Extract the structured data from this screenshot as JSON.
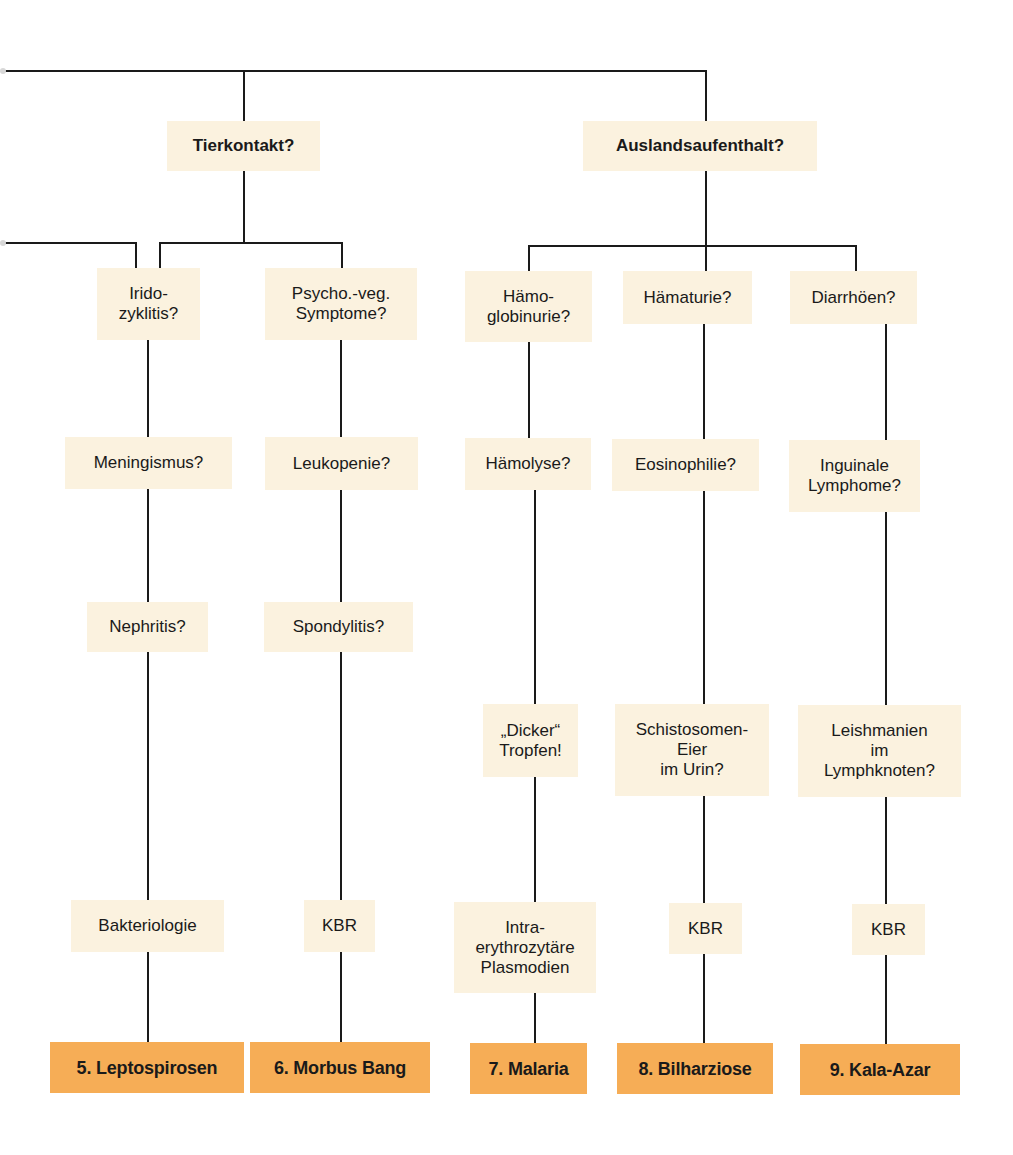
{
  "colors": {
    "line": "#1a1a1a",
    "question_box": "#fbf2df",
    "diagnosis_box": "#f6ad56",
    "text": "#1a1a1a"
  },
  "diagram": {
    "type": "flowchart",
    "continues_from_left": true,
    "branches": [
      {
        "id": "tierkontakt",
        "question": "Tierkontakt?",
        "box": {
          "x": 167,
          "y": 121,
          "w": 153,
          "h": 50
        },
        "columns": [
          {
            "id": "col-leptospirosen",
            "steps": [
              {
                "text": "Irido-\nzyklitis?",
                "box": {
                  "x": 97,
                  "y": 268,
                  "w": 103,
                  "h": 72
                }
              },
              {
                "text": "Meningismus?",
                "box": {
                  "x": 65,
                  "y": 437,
                  "w": 167,
                  "h": 52
                }
              },
              {
                "text": "Nephritis?",
                "box": {
                  "x": 87,
                  "y": 602,
                  "w": 121,
                  "h": 50
                }
              },
              {
                "text": "Bakteriologie",
                "box": {
                  "x": 71,
                  "y": 900,
                  "w": 153,
                  "h": 52
                }
              }
            ],
            "diagnosis": {
              "text": "5. Leptospirosen",
              "box": {
                "x": 50,
                "y": 1042,
                "w": 194,
                "h": 51
              }
            }
          },
          {
            "id": "col-morbus-bang",
            "steps": [
              {
                "text": "Psycho.-veg.\nSymptome?",
                "box": {
                  "x": 265,
                  "y": 268,
                  "w": 152,
                  "h": 72
                }
              },
              {
                "text": "Leukopenie?",
                "box": {
                  "x": 265,
                  "y": 437,
                  "w": 153,
                  "h": 53
                }
              },
              {
                "text": "Spondylitis?",
                "box": {
                  "x": 264,
                  "y": 602,
                  "w": 149,
                  "h": 50
                }
              },
              {
                "text": "KBR",
                "box": {
                  "x": 304,
                  "y": 900,
                  "w": 71,
                  "h": 52
                }
              }
            ],
            "diagnosis": {
              "text": "6. Morbus Bang",
              "box": {
                "x": 250,
                "y": 1042,
                "w": 180,
                "h": 51
              }
            }
          }
        ]
      },
      {
        "id": "auslandsaufenthalt",
        "question": "Auslandsaufenthalt?",
        "box": {
          "x": 583,
          "y": 121,
          "w": 234,
          "h": 50
        },
        "columns": [
          {
            "id": "col-malaria",
            "steps": [
              {
                "text": "Hämo-\nglobinurie?",
                "box": {
                  "x": 465,
                  "y": 271,
                  "w": 127,
                  "h": 71
                }
              },
              {
                "text": "Hämolyse?",
                "box": {
                  "x": 465,
                  "y": 438,
                  "w": 126,
                  "h": 52
                }
              },
              {
                "text": "„Dicker“\nTropfen!",
                "box": {
                  "x": 483,
                  "y": 704,
                  "w": 95,
                  "h": 73
                }
              },
              {
                "text": "Intra-\nerythrozytäre\nPlasmodien",
                "box": {
                  "x": 454,
                  "y": 902,
                  "w": 142,
                  "h": 91
                }
              }
            ],
            "diagnosis": {
              "text": "7. Malaria",
              "box": {
                "x": 470,
                "y": 1043,
                "w": 117,
                "h": 51
              }
            }
          },
          {
            "id": "col-bilharziose",
            "steps": [
              {
                "text": "Hämaturie?",
                "box": {
                  "x": 623,
                  "y": 271,
                  "w": 129,
                  "h": 53
                }
              },
              {
                "text": "Eosinophilie?",
                "box": {
                  "x": 612,
                  "y": 439,
                  "w": 147,
                  "h": 52
                }
              },
              {
                "text": "Schistosomen-\nEier\nim Urin?",
                "box": {
                  "x": 615,
                  "y": 704,
                  "w": 154,
                  "h": 92
                }
              },
              {
                "text": "KBR",
                "box": {
                  "x": 669,
                  "y": 903,
                  "w": 73,
                  "h": 51
                }
              }
            ],
            "diagnosis": {
              "text": "8. Bilharziose",
              "box": {
                "x": 617,
                "y": 1043,
                "w": 156,
                "h": 51
              }
            }
          },
          {
            "id": "col-kala-azar",
            "steps": [
              {
                "text": "Diarrhöen?",
                "box": {
                  "x": 790,
                  "y": 271,
                  "w": 127,
                  "h": 53
                }
              },
              {
                "text": "Inguinale\nLymphome?",
                "box": {
                  "x": 789,
                  "y": 440,
                  "w": 131,
                  "h": 72
                }
              },
              {
                "text": "Leishmanien\nim\nLymphknoten?",
                "box": {
                  "x": 798,
                  "y": 705,
                  "w": 163,
                  "h": 92
                }
              },
              {
                "text": "KBR",
                "box": {
                  "x": 852,
                  "y": 904,
                  "w": 73,
                  "h": 51
                }
              }
            ],
            "diagnosis": {
              "text": "9. Kala-Azar",
              "box": {
                "x": 800,
                "y": 1044,
                "w": 160,
                "h": 51
              }
            }
          }
        ]
      }
    ],
    "lines": [
      {
        "from": [
          4,
          71
        ],
        "to": [
          706,
          71
        ]
      },
      {
        "from": [
          244,
          71
        ],
        "to": [
          244,
          121
        ]
      },
      {
        "from": [
          706,
          71
        ],
        "to": [
          706,
          121
        ]
      },
      {
        "from": [
          244,
          171
        ],
        "to": [
          244,
          243
        ]
      },
      {
        "from": [
          4,
          243
        ],
        "to": [
          136,
          243
        ]
      },
      {
        "from": [
          136,
          243
        ],
        "to": [
          136,
          268
        ]
      },
      {
        "from": [
          160,
          243
        ],
        "to": [
          342,
          243
        ]
      },
      {
        "from": [
          160,
          243
        ],
        "to": [
          160,
          268
        ]
      },
      {
        "from": [
          342,
          243
        ],
        "to": [
          342,
          268
        ]
      },
      {
        "from": [
          706,
          171
        ],
        "to": [
          706,
          271
        ]
      },
      {
        "from": [
          529,
          246
        ],
        "to": [
          856,
          246
        ]
      },
      {
        "from": [
          529,
          246
        ],
        "to": [
          529,
          271
        ]
      },
      {
        "from": [
          856,
          246
        ],
        "to": [
          856,
          271
        ]
      },
      {
        "from": [
          148,
          340
        ],
        "to": [
          148,
          437
        ]
      },
      {
        "from": [
          148,
          489
        ],
        "to": [
          148,
          602
        ]
      },
      {
        "from": [
          148,
          652
        ],
        "to": [
          148,
          900
        ]
      },
      {
        "from": [
          148,
          952
        ],
        "to": [
          148,
          1042
        ]
      },
      {
        "from": [
          341,
          340
        ],
        "to": [
          341,
          437
        ]
      },
      {
        "from": [
          341,
          490
        ],
        "to": [
          341,
          602
        ]
      },
      {
        "from": [
          341,
          652
        ],
        "to": [
          341,
          900
        ]
      },
      {
        "from": [
          341,
          952
        ],
        "to": [
          341,
          1042
        ]
      },
      {
        "from": [
          529,
          342
        ],
        "to": [
          529,
          438
        ]
      },
      {
        "from": [
          535,
          490
        ],
        "to": [
          535,
          704
        ]
      },
      {
        "from": [
          535,
          777
        ],
        "to": [
          535,
          902
        ]
      },
      {
        "from": [
          535,
          993
        ],
        "to": [
          535,
          1043
        ]
      },
      {
        "from": [
          704,
          324
        ],
        "to": [
          704,
          439
        ]
      },
      {
        "from": [
          704,
          491
        ],
        "to": [
          704,
          704
        ]
      },
      {
        "from": [
          704,
          796
        ],
        "to": [
          704,
          903
        ]
      },
      {
        "from": [
          704,
          954
        ],
        "to": [
          704,
          1043
        ]
      },
      {
        "from": [
          886,
          324
        ],
        "to": [
          886,
          440
        ]
      },
      {
        "from": [
          886,
          512
        ],
        "to": [
          886,
          705
        ]
      },
      {
        "from": [
          886,
          797
        ],
        "to": [
          886,
          904
        ]
      },
      {
        "from": [
          886,
          955
        ],
        "to": [
          886,
          1044
        ]
      }
    ]
  }
}
